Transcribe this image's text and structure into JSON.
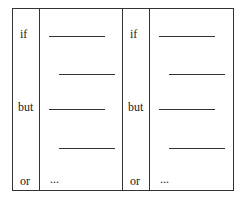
{
  "panels": [
    {
      "labels": {
        "if": "if",
        "but": "but",
        "or": "or"
      },
      "ellipsis": "..."
    },
    {
      "labels": {
        "if": "if",
        "but": "but",
        "or": "or"
      },
      "ellipsis": "..."
    }
  ]
}
